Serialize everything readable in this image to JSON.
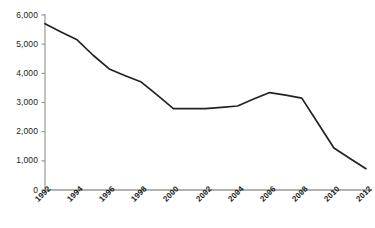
{
  "chart_data": {
    "type": "line",
    "title": "",
    "subtitle": "",
    "xlabel": "",
    "ylabel": "",
    "grid": false,
    "legend": false,
    "legend_position": "none",
    "line_color": "#222222",
    "axis_color": "#999999",
    "background_color": "#ffffff",
    "xlim": [
      1992,
      2012
    ],
    "ylim": [
      0,
      6000
    ],
    "ytick_labels": [
      "6,000",
      "5,000",
      "4,000",
      "3,000",
      "2,000",
      "1,000",
      "0"
    ],
    "ytick_values": [
      6000,
      5000,
      4000,
      3000,
      2000,
      1000,
      0
    ],
    "xtick_labels": [
      "1992",
      "1994",
      "1996",
      "1998",
      "2000",
      "2002",
      "2004",
      "2006",
      "2008",
      "2010",
      "2012"
    ],
    "xtick_values": [
      1992,
      1994,
      1996,
      1998,
      2000,
      2002,
      2004,
      2006,
      2008,
      2010,
      2012
    ],
    "x": [
      1992,
      1993,
      1994,
      1995,
      1996,
      1997,
      1998,
      1999,
      2000,
      2001,
      2002,
      2003,
      2004,
      2005,
      2006,
      2007,
      2008,
      2009,
      2010,
      2011,
      2012
    ],
    "values": [
      5700,
      5420,
      5150,
      4620,
      4150,
      3920,
      3700,
      3250,
      2790,
      2790,
      2790,
      2830,
      2880,
      3120,
      3340,
      3250,
      3150,
      2300,
      1440,
      1080,
      730
    ],
    "series": [
      {
        "name": "series-1",
        "values": [
          5700,
          5420,
          5150,
          4620,
          4150,
          3920,
          3700,
          3250,
          2790,
          2790,
          2790,
          2830,
          2880,
          3120,
          3340,
          3250,
          3150,
          2300,
          1440,
          1080,
          730
        ]
      }
    ]
  }
}
